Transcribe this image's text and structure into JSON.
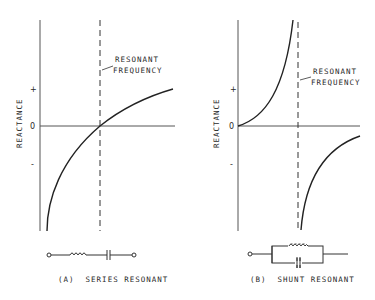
{
  "panels": [
    {
      "id": "A",
      "caption": "(A)  SERIES RESONANT",
      "y_axis_label": "REACTANCE",
      "ticks": {
        "plus": "+",
        "zero": "0",
        "minus": "-"
      },
      "annotation": {
        "line1": "RESONANT",
        "line2": "FREQUENCY"
      },
      "circuit": "series inductor and capacitor"
    },
    {
      "id": "B",
      "caption": "(B)  SHUNT RESONANT",
      "y_axis_label": "REACTANCE",
      "ticks": {
        "plus": "+",
        "zero": "0",
        "minus": "-"
      },
      "annotation": {
        "line1": "RESONANT",
        "line2": "FREQUENCY"
      },
      "circuit": "parallel inductor and capacitor"
    }
  ],
  "colors": {
    "ink": "#222222",
    "axis": "#555555",
    "background": "#ffffff"
  }
}
